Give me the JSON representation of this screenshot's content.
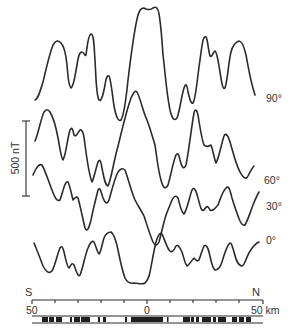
{
  "figure": {
    "profiles": [
      {
        "label": "90°",
        "label_x": 266,
        "label_y": 102
      },
      {
        "label": "60°",
        "label_x": 264,
        "label_y": 184
      },
      {
        "label": "30°",
        "label_x": 266,
        "label_y": 210
      },
      {
        "label": "0°",
        "label_x": 266,
        "label_y": 243
      }
    ],
    "amplitude_scale": {
      "label": "500 nT",
      "value": 500,
      "unit": "nT"
    },
    "direction": {
      "left": "S",
      "right": "N"
    },
    "distance_axis": {
      "tick_labels": {
        "left": "50",
        "center": "0",
        "right": "50 km"
      },
      "range_km": [
        -50,
        50
      ],
      "tick_interval_km": 10
    },
    "stripe_pattern_label": "normal/reversed magnetization blocks"
  }
}
